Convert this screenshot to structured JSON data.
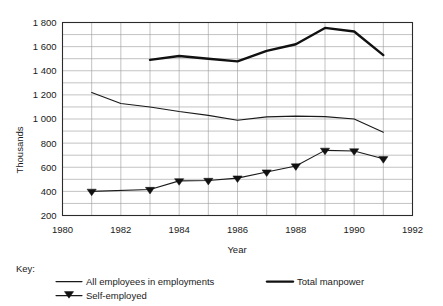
{
  "chart_data": {
    "type": "line",
    "title": "",
    "xlabel": "Year",
    "ylabel": "Thousands",
    "xlim": [
      1980,
      1992
    ],
    "ylim": [
      200,
      1800
    ],
    "x_ticks": [
      1980,
      1982,
      1984,
      1986,
      1988,
      1990,
      1992
    ],
    "x_tick_labels": [
      "1980",
      "1982",
      "1984",
      "1986",
      "1988",
      "1990",
      "1992"
    ],
    "y_ticks": [
      200,
      400,
      600,
      800,
      1000,
      1200,
      1400,
      1600,
      1800
    ],
    "y_tick_labels": [
      "200",
      "400",
      "600",
      "800",
      "1 000",
      "1 200",
      "1 400",
      "1 600",
      "1 800"
    ],
    "y_minor_step": 100,
    "x_minor_step": 1,
    "grid": true,
    "legend_position": "bottom",
    "legend_title": "Key:",
    "series": [
      {
        "name": "All employees in employments",
        "style": "thin-line",
        "x": [
          1981,
          1982,
          1983,
          1984,
          1985,
          1986,
          1987,
          1988,
          1989,
          1990,
          1991
        ],
        "values": [
          1220,
          1128,
          1100,
          1062,
          1030,
          990,
          1018,
          1024,
          1020,
          1000,
          890
        ]
      },
      {
        "name": "Total manpower",
        "style": "thick-line",
        "x": [
          1983,
          1984,
          1985,
          1986,
          1987,
          1988,
          1989,
          1990,
          1991
        ],
        "values": [
          1490,
          1522,
          1500,
          1478,
          1565,
          1620,
          1755,
          1725,
          1530
        ]
      },
      {
        "name": "Self-employed",
        "style": "line-with-down-triangle-markers",
        "x": [
          1981,
          1983,
          1984,
          1985,
          1986,
          1987,
          1988,
          1989,
          1990,
          1991
        ],
        "values": [
          400,
          415,
          487,
          490,
          510,
          560,
          610,
          740,
          735,
          670
        ]
      }
    ]
  },
  "legend": {
    "key_label": "Key:",
    "entries": [
      {
        "label": "All employees in employments",
        "marker": "thin-line"
      },
      {
        "label": "Total manpower",
        "marker": "thick-line"
      },
      {
        "label": "Self-employed",
        "marker": "down-triangle-line"
      }
    ]
  },
  "colors": {
    "background": "#ffffff",
    "ink": "#1a1a1a",
    "grid": "#9a9a9a",
    "frame": "#2b2b2b"
  }
}
